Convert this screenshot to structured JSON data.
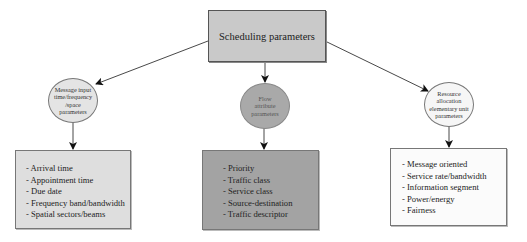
{
  "root": {
    "label": "Scheduling parameters",
    "fill": "#c9c9c9"
  },
  "categories": [
    {
      "label_lines": [
        "Message input",
        "time/frequency",
        "/space",
        "parameters"
      ],
      "ellipse_fill": "#e4e4e4",
      "box_fill": "#dedede",
      "items": [
        "- Arrival time",
        "- Appointment time",
        "- Due date",
        "- Frequency band/bandwidth",
        "- Spatial sectors/beams"
      ]
    },
    {
      "label_lines": [
        "Flow",
        "attribute",
        "parameters"
      ],
      "ellipse_fill": "#a9a9a9",
      "box_fill": "#a3a3a3",
      "items": [
        "- Priority",
        "- Traffic class",
        "- Service class",
        "- Source-destination",
        "- Traffic descriptor"
      ]
    },
    {
      "label_lines": [
        "Resource",
        "allocation",
        "elementary unit",
        "parameters"
      ],
      "ellipse_fill": "#f6f6f6",
      "box_fill": "#fbfbfb",
      "items": [
        "- Message oriented",
        "- Service rate/bandwidth",
        "- Information segment",
        "- Power/energy",
        "- Fairness"
      ]
    }
  ]
}
